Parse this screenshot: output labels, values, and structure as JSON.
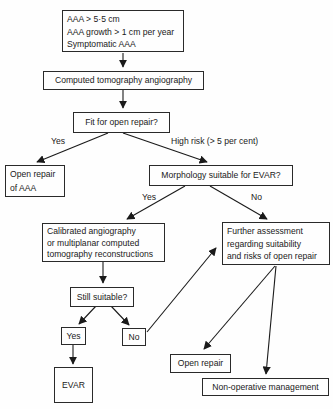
{
  "flowchart": {
    "nodes": {
      "criteria": {
        "lines": [
          "AAA > 5·5 cm",
          "AAA growth > 1 cm per year",
          "Symptomatic AAA"
        ]
      },
      "cta": {
        "label": "Computed tomography angiography"
      },
      "fit": {
        "label": "Fit for open repair?"
      },
      "open_repair_aaa": {
        "lines": [
          "Open repair",
          "of AAA"
        ]
      },
      "morphology": {
        "label": "Morphology suitable for EVAR?"
      },
      "calibrated": {
        "lines": [
          "Calibrated angiography",
          "or multiplanar computed",
          "tomography reconstructions"
        ]
      },
      "further": {
        "lines": [
          "Further assessment",
          "regarding suitability",
          "and risks of open repair"
        ]
      },
      "still_suitable": {
        "label": "Still suitable?"
      },
      "yes_box": {
        "label": "Yes"
      },
      "no_box": {
        "label": "No"
      },
      "evar": {
        "label": "EVAR"
      },
      "open_repair": {
        "label": "Open repair"
      },
      "non_operative": {
        "label": "Non-operative management"
      }
    },
    "edge_labels": {
      "fit_yes": "Yes",
      "fit_high_risk": "High risk (> 5 per cent)",
      "morph_yes": "Yes",
      "morph_no": "No"
    },
    "colors": {
      "line": "#1a1a1a",
      "background": "#fefefe"
    }
  }
}
